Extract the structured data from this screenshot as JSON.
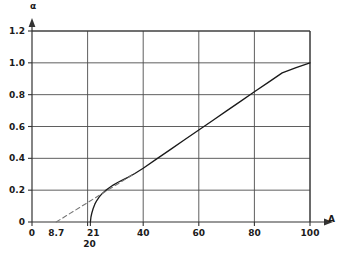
{
  "chart_data": {
    "type": "line",
    "title": "",
    "xlabel": "A",
    "ylabel": "α",
    "xlim": [
      0,
      100
    ],
    "ylim": [
      0,
      1.2
    ],
    "grid": true,
    "legend": "none",
    "x_ticks": [
      0,
      20,
      40,
      60,
      80,
      100
    ],
    "x_tick_labels": [
      "0",
      "20",
      "40",
      "60",
      "80",
      "100"
    ],
    "y_ticks": [
      0,
      0.2,
      0.4,
      0.6,
      0.8,
      1.0,
      1.2
    ],
    "y_tick_labels": [
      "0",
      "0.2",
      "0.4",
      "0.6",
      "0.8",
      "1.0",
      "1.2"
    ],
    "annotations": [
      {
        "name": "dashed-intercept",
        "text": "8.7",
        "x": 8.7,
        "y": 0
      },
      {
        "name": "curve-onset",
        "text": "21",
        "x": 21,
        "y": 0
      },
      {
        "name": "gridline-twenty",
        "text": "20",
        "x": 20,
        "y": 0
      }
    ],
    "series": [
      {
        "name": "alpha-curve",
        "style": "solid",
        "color": "#1a1a1a",
        "points": [
          [
            21.0,
            0.0
          ],
          [
            21.2,
            0.03
          ],
          [
            21.5,
            0.055
          ],
          [
            22.0,
            0.085
          ],
          [
            22.6,
            0.112
          ],
          [
            23.3,
            0.135
          ],
          [
            24.2,
            0.158
          ],
          [
            25.2,
            0.178
          ],
          [
            26.4,
            0.197
          ],
          [
            27.8,
            0.215
          ],
          [
            29.2,
            0.232
          ],
          [
            30.8,
            0.248
          ],
          [
            32.5,
            0.263
          ],
          [
            34.5,
            0.28
          ],
          [
            37.0,
            0.305
          ],
          [
            40.0,
            0.338
          ],
          [
            45.0,
            0.398
          ],
          [
            50.0,
            0.458
          ],
          [
            55.0,
            0.518
          ],
          [
            60.0,
            0.578
          ],
          [
            65.0,
            0.638
          ],
          [
            70.0,
            0.698
          ],
          [
            75.0,
            0.758
          ],
          [
            80.0,
            0.818
          ],
          [
            85.0,
            0.877
          ],
          [
            90.0,
            0.937
          ],
          [
            95.0,
            0.97
          ],
          [
            100.0,
            1.0
          ]
        ]
      },
      {
        "name": "asymptote-line",
        "style": "dashed",
        "color": "#777777",
        "points": [
          [
            8.7,
            0.0
          ],
          [
            36.0,
            0.295
          ]
        ]
      }
    ]
  },
  "axes": {
    "y_arrow_label": "α",
    "x_arrow_label": "A"
  },
  "caption": {
    "text": ""
  }
}
